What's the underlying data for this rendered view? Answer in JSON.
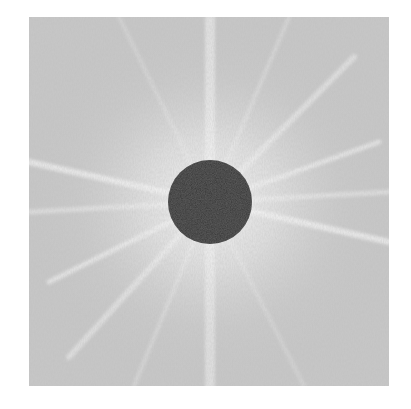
{
  "image": {
    "description": "Grayscale Fourier power spectrum with radial streaks and masked central DC component",
    "background_color": "#ffffff",
    "field_color": "#c4c4c4",
    "glow_color": "#f2f2f2",
    "streak_color": "#f4f4f4",
    "mask_color": "#333333",
    "mask": {
      "shape": "circle",
      "center_x": 181,
      "center_y": 185,
      "radius": 42
    },
    "streaks": [
      {
        "x2": 181,
        "y2": 0,
        "width": 10,
        "opacity": 0.55
      },
      {
        "x2": 181,
        "y2": 369,
        "width": 10,
        "opacity": 0.5
      },
      {
        "x2": 0,
        "y2": 145,
        "width": 6,
        "opacity": 0.7
      },
      {
        "x2": 360,
        "y2": 225,
        "width": 6,
        "opacity": 0.7
      },
      {
        "x2": 0,
        "y2": 195,
        "width": 5,
        "opacity": 0.45
      },
      {
        "x2": 360,
        "y2": 175,
        "width": 5,
        "opacity": 0.45
      },
      {
        "x2": 20,
        "y2": 265,
        "width": 5,
        "opacity": 0.6
      },
      {
        "x2": 350,
        "y2": 125,
        "width": 5,
        "opacity": 0.6
      },
      {
        "x2": 40,
        "y2": 340,
        "width": 6,
        "opacity": 0.5
      },
      {
        "x2": 325,
        "y2": 40,
        "width": 6,
        "opacity": 0.5
      },
      {
        "x2": 105,
        "y2": 369,
        "width": 4,
        "opacity": 0.3
      },
      {
        "x2": 260,
        "y2": 0,
        "width": 4,
        "opacity": 0.3
      },
      {
        "x2": 90,
        "y2": 0,
        "width": 4,
        "opacity": 0.25
      },
      {
        "x2": 275,
        "y2": 369,
        "width": 4,
        "opacity": 0.25
      }
    ]
  }
}
